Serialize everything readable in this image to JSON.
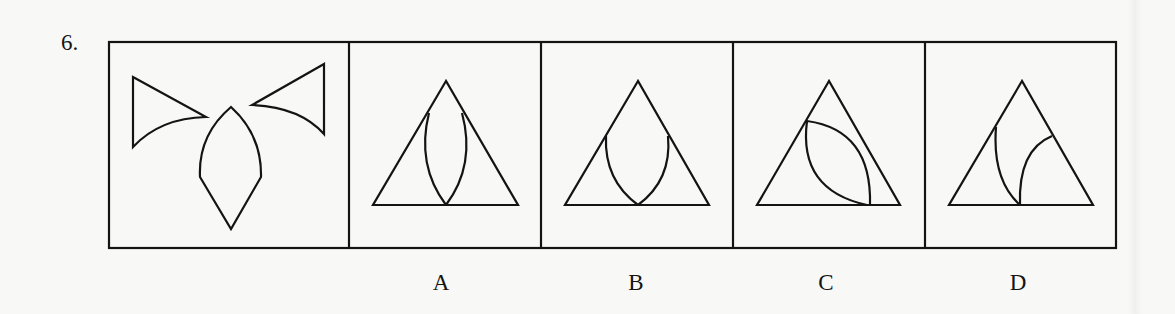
{
  "question": {
    "number": "6."
  },
  "panels": [
    {
      "id": "question",
      "description": "two concave-edged triangles and a lens-shaped pointed piece"
    },
    {
      "id": "A",
      "description": "triangle with vertical lens from apex to base midpoint"
    },
    {
      "id": "B",
      "description": "triangle with U-shaped lens from side edges to base midpoint"
    },
    {
      "id": "C",
      "description": "triangle with tilted lens from left edge to base"
    },
    {
      "id": "D",
      "description": "triangle with two separate arcs meeting at base midpoint"
    }
  ],
  "options": [
    {
      "label": "A"
    },
    {
      "label": "B"
    },
    {
      "label": "C"
    },
    {
      "label": "D"
    }
  ],
  "colors": {
    "line": "#141414",
    "background": "#f8f8f7"
  }
}
